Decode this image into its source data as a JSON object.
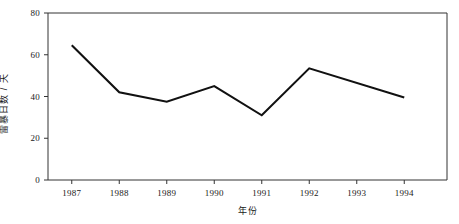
{
  "chart_data": {
    "type": "line",
    "title": "",
    "xlabel": "年份",
    "ylabel": "雷暴日数 / 天",
    "categories": [
      "1987",
      "1988",
      "1989",
      "1990",
      "1991",
      "1992",
      "1993",
      "1994"
    ],
    "x": [
      1987,
      1988,
      1989,
      1990,
      1991,
      1992,
      1993,
      1994
    ],
    "values": [
      64.5,
      42.0,
      37.5,
      45.0,
      31.0,
      53.5,
      46.5,
      39.5
    ],
    "vertex_years": [
      "1987",
      "1988",
      "1989",
      "1990",
      "1991",
      "1992",
      "1994"
    ],
    "series": [
      {
        "name": "雷暴日数",
        "values": [
          64.5,
          42.0,
          37.5,
          45.0,
          31.0,
          53.5,
          46.5,
          39.5
        ]
      }
    ],
    "xlim": [
      1986.5,
      1994.9
    ],
    "ylim": [
      0,
      80
    ],
    "yticks": [
      0,
      20,
      40,
      60,
      80
    ],
    "ytick_labels": [
      "0",
      "20",
      "40",
      "60",
      "80"
    ],
    "xticks": [
      1987,
      1988,
      1989,
      1990,
      1991,
      1992,
      1993,
      1994
    ],
    "xtick_labels": [
      "1987",
      "1988",
      "1989",
      "1990",
      "1991",
      "1992",
      "1993",
      "1994"
    ],
    "grid": false,
    "legend": false,
    "legend_position": "none",
    "line_color": "#111111",
    "axis_color": "#333333",
    "background_color": "#ffffff",
    "markers": false,
    "annotations": []
  }
}
